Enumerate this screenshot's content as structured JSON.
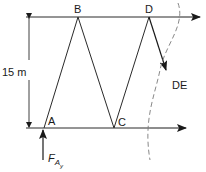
{
  "diagram": {
    "type": "truss-section-free-body-diagram",
    "colors": {
      "line": "#2a2a2a",
      "dashed": "#7a7a7a",
      "background": "#ffffff"
    },
    "nodes": [
      {
        "id": "A",
        "label": "A"
      },
      {
        "id": "B",
        "label": "B"
      },
      {
        "id": "C",
        "label": "C"
      },
      {
        "id": "D",
        "label": "D"
      }
    ],
    "members": [
      {
        "from": "A",
        "to": "B"
      },
      {
        "from": "B",
        "to": "C"
      },
      {
        "from": "C",
        "to": "D"
      },
      {
        "from": "D",
        "to": "E",
        "label": "DE"
      },
      {
        "top_chord": "B-D"
      },
      {
        "bottom_chord": "A-C"
      }
    ],
    "dimension": {
      "label": "15 m"
    },
    "forces": {
      "reaction": {
        "label_main": "F",
        "label_sub": "A",
        "label_subsub": "y",
        "direction": "up"
      },
      "member_force_DE": {
        "label": "DE",
        "direction": "down-right"
      },
      "top_chord_force": {
        "direction": "right"
      },
      "bottom_chord_force": {
        "direction": "right"
      }
    },
    "section_cut": {
      "style": "dashed"
    }
  }
}
